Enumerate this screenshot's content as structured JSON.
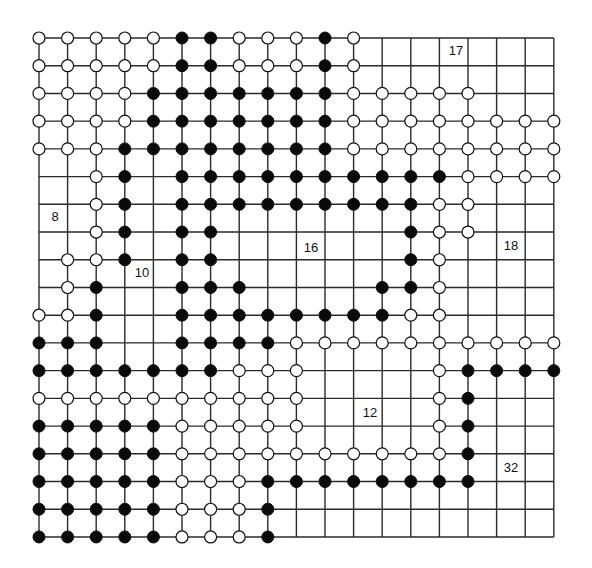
{
  "diagram": {
    "type": "go-board",
    "size": 19,
    "grid": {
      "x0": 39,
      "dx": 28.6,
      "y0": 38,
      "dy": 27.72
    },
    "stone_radius": 6,
    "colors": {
      "line": "#2a2a2a",
      "black": "#0a0a0a",
      "white": "#ffffff",
      "background": "#ffffff"
    },
    "rows": [
      "WWWWWBBWWWBW.......",
      "WWWWWBBWWWBW.......",
      "WWWWBBBBBBBWWWWW...",
      "WWWWBBBBBBBWWWWWWWW",
      "WWWBBBBBBBBWWWWWWWW",
      "..WB.BBBBBBBBBBWWWW",
      "..WB.BBBBBBBBBWW...",
      "..WB.BB......BWW...",
      ".WWB.BB......BW....",
      ".WB..BBB....BBW....",
      "WWB..BBBBBBBBWW....",
      "BBB..BBBBWWWWWWWWWW",
      "BBBBBBBWWW....WBBBB",
      "WWWWWWWWWW....WB...",
      "BBBBBWWWWW....WB...",
      "BBBBBWWWWWWWWWWB...",
      "BBBBBWWWBBBBBBBB...",
      "BBBBBWWWB..........",
      "BBBBBWWWB.........."
    ],
    "labels": [
      {
        "text": "17",
        "x": 456,
        "y": 52
      },
      {
        "text": "8",
        "x": 55,
        "y": 218
      },
      {
        "text": "16",
        "x": 311,
        "y": 249
      },
      {
        "text": "18",
        "x": 511,
        "y": 247
      },
      {
        "text": "10",
        "x": 142,
        "y": 274
      },
      {
        "text": "12",
        "x": 370,
        "y": 414
      },
      {
        "text": "32",
        "x": 511,
        "y": 469
      }
    ]
  }
}
